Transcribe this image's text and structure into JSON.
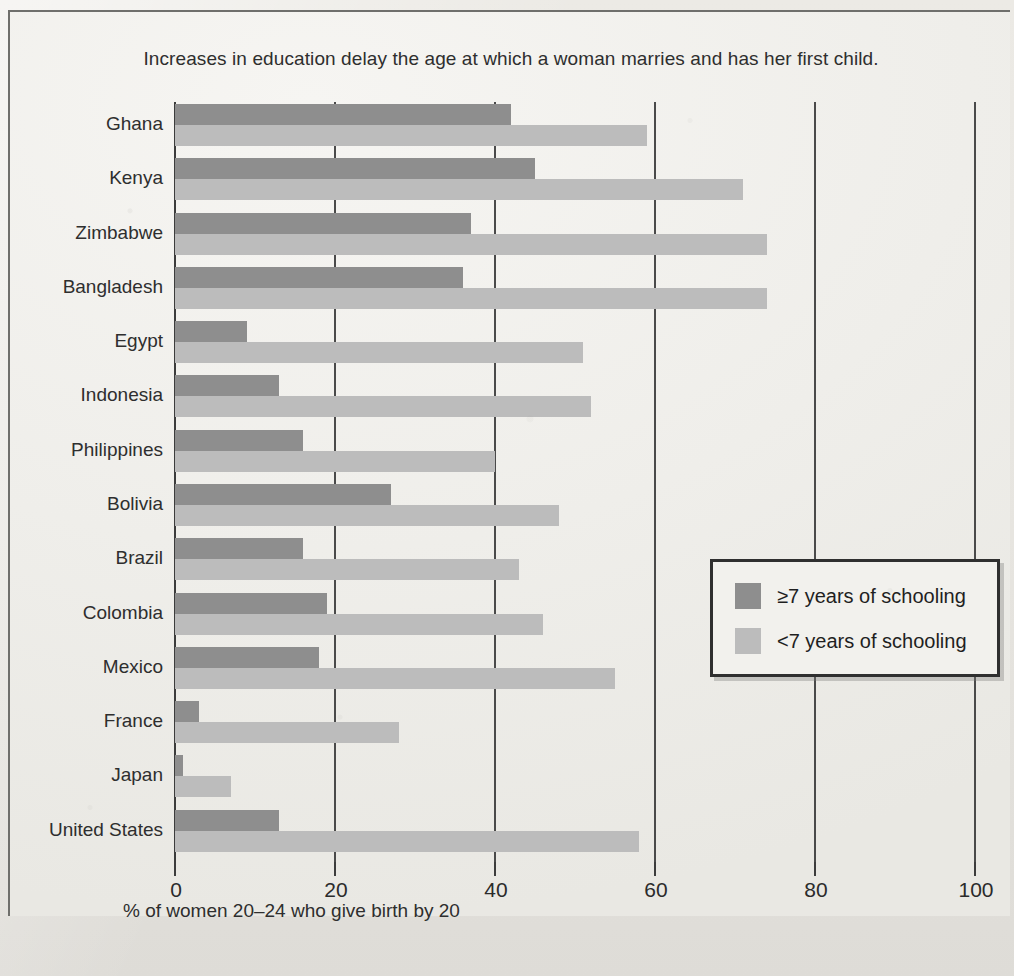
{
  "figure": {
    "title": "Increases in education delay the age at which a woman marries and has her first child.",
    "xlabel": "% of women 20–24 who give birth by 20"
  },
  "legend": {
    "items": [
      {
        "label": "≥7 years of schooling",
        "color": "#8e8e8e",
        "swatch": "dark-gray-swatch"
      },
      {
        "label": "<7 years of schooling",
        "color": "#bcbcbc",
        "swatch": "light-gray-swatch"
      }
    ]
  },
  "axis": {
    "ticks": [
      "0",
      "20",
      "40",
      "60",
      "80",
      "100"
    ],
    "tick_values": [
      0,
      20,
      40,
      60,
      80,
      100
    ],
    "min": 0,
    "max": 100
  },
  "chart_data": {
    "type": "bar",
    "orientation": "horizontal",
    "title": "Increases in education delay the age at which a woman marries and has her first child.",
    "xlabel": "% of women 20–24 who give birth by 20",
    "ylabel": "",
    "xlim": [
      0,
      100
    ],
    "grid": true,
    "grid_axis": "x",
    "legend_position": "center-right",
    "categories": [
      "Ghana",
      "Kenya",
      "Zimbabwe",
      "Bangladesh",
      "Egypt",
      "Indonesia",
      "Philippines",
      "Bolivia",
      "Brazil",
      "Colombia",
      "Mexico",
      "France",
      "Japan",
      "United States"
    ],
    "series": [
      {
        "name": "≥7 years of schooling",
        "color": "#8e8e8e",
        "values": [
          42,
          45,
          37,
          36,
          9,
          13,
          16,
          27,
          16,
          19,
          18,
          3,
          1,
          13
        ]
      },
      {
        "name": "<7 years of schooling",
        "color": "#bcbcbc",
        "values": [
          59,
          71,
          74,
          74,
          51,
          52,
          40,
          48,
          43,
          46,
          55,
          28,
          7,
          58
        ]
      }
    ]
  }
}
